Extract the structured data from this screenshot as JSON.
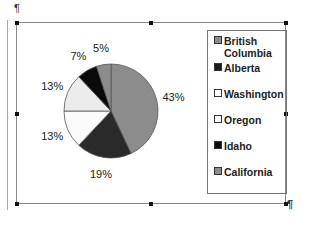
{
  "document": {
    "pilcrow_top": "¶",
    "pilcrow_bottom": "¶"
  },
  "chart_data": {
    "type": "pie",
    "title": "",
    "start_angle_deg": 0,
    "direction": "clockwise",
    "legend_position": "right",
    "slices": [
      {
        "label": "California",
        "value": 43,
        "display": "43%",
        "color": "#8c8c8c"
      },
      {
        "label": "Idaho",
        "value": 19,
        "display": "19%",
        "color": "#2a2a2a"
      },
      {
        "label": "Oregon",
        "value": 13,
        "display": "13%",
        "color": "#fbfbfb"
      },
      {
        "label": "Washington",
        "value": 13,
        "display": "13%",
        "color": "#ececec"
      },
      {
        "label": "Alberta",
        "value": 7,
        "display": "7%",
        "color": "#0a0a0a"
      },
      {
        "label": "British Columbia",
        "value": 5,
        "display": "5%",
        "color": "#8c8c8c"
      }
    ],
    "legend": [
      {
        "label": "British Columbia",
        "lines": [
          "British",
          "Columbia"
        ],
        "color": "#8c8c8c"
      },
      {
        "label": "Alberta",
        "lines": [
          "Alberta"
        ],
        "color": "#1a1a1a"
      },
      {
        "label": "Washington",
        "lines": [
          "Washington"
        ],
        "color": "#ffffff"
      },
      {
        "label": "Oregon",
        "lines": [
          "Oregon"
        ],
        "color": "#ffffff"
      },
      {
        "label": "Idaho",
        "lines": [
          "Idaho"
        ],
        "color": "#0a0a0a"
      },
      {
        "label": "California",
        "lines": [
          "California"
        ],
        "color": "#8c8c8c"
      }
    ]
  }
}
